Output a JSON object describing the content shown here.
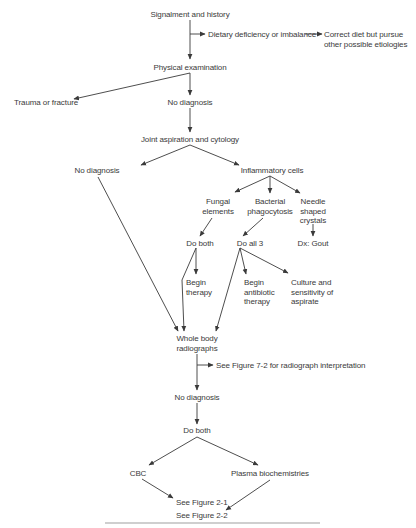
{
  "diagram": {
    "type": "flowchart",
    "nodes": {
      "signalment": "Signalment and history",
      "dietary": "Dietary deficiency or imbalance",
      "correct_diet_l1": "Correct diet but pursue",
      "correct_diet_l2": "other possible etiologies",
      "physical_exam": "Physical examination",
      "trauma": "Trauma or fracture",
      "no_dx_1": "No diagnosis",
      "joint_aspiration": "Joint aspiration and cytology",
      "no_dx_2": "No diagnosis",
      "inflammatory": "Inflammatory cells",
      "fungal_l1": "Fungal",
      "fungal_l2": "elements",
      "bacterial_l1": "Bacterial",
      "bacterial_l2": "phagocytosis",
      "needle_l1": "Needle",
      "needle_l2": "shaped",
      "needle_l3": "crystals",
      "do_both_1": "Do both",
      "do_all_3": "Do all 3",
      "gout": "Dx: Gout",
      "begin_therapy_l1": "Begin",
      "begin_therapy_l2": "therapy",
      "begin_abx_l1": "Begin",
      "begin_abx_l2": "antibiotic",
      "begin_abx_l3": "therapy",
      "culture_l1": "Culture and",
      "culture_l2": "sensitivity of",
      "culture_l3": "aspirate",
      "radiographs_l1": "Whole body",
      "radiographs_l2": "radiographs",
      "see_fig_7_2": "See Figure 7-2 for radiograph interpretation",
      "no_dx_3": "No diagnosis",
      "do_both_2": "Do both",
      "cbc": "CBC",
      "plasma": "Plasma biochemistries",
      "see_fig_2_1": "See Figure 2-1",
      "see_fig_2_2": "See Figure 2-2"
    },
    "edges": [
      [
        "Signalment and history",
        "Physical examination"
      ],
      [
        "Signalment and history",
        "Dietary deficiency or imbalance"
      ],
      [
        "Dietary deficiency or imbalance",
        "Correct diet but pursue other possible etiologies"
      ],
      [
        "Physical examination",
        "Trauma or fracture"
      ],
      [
        "Physical examination",
        "No diagnosis"
      ],
      [
        "No diagnosis",
        "Joint aspiration and cytology"
      ],
      [
        "Joint aspiration and cytology",
        "No diagnosis"
      ],
      [
        "Joint aspiration and cytology",
        "Inflammatory cells"
      ],
      [
        "Inflammatory cells",
        "Fungal elements"
      ],
      [
        "Inflammatory cells",
        "Bacterial phagocytosis"
      ],
      [
        "Inflammatory cells",
        "Needle shaped crystals"
      ],
      [
        "Fungal elements",
        "Do both"
      ],
      [
        "Bacterial phagocytosis",
        "Do all 3"
      ],
      [
        "Needle shaped crystals",
        "Dx: Gout"
      ],
      [
        "Do both",
        "Begin therapy"
      ],
      [
        "Do both",
        "Whole body radiographs"
      ],
      [
        "Do all 3",
        "Begin antibiotic therapy"
      ],
      [
        "Do all 3",
        "Culture and sensitivity of aspirate"
      ],
      [
        "Do all 3",
        "Whole body radiographs"
      ],
      [
        "No diagnosis (aspiration)",
        "Whole body radiographs"
      ],
      [
        "Whole body radiographs",
        "See Figure 7-2 for radiograph interpretation"
      ],
      [
        "Whole body radiographs",
        "No diagnosis"
      ],
      [
        "No diagnosis",
        "Do both"
      ],
      [
        "Do both",
        "CBC"
      ],
      [
        "Do both",
        "Plasma biochemistries"
      ],
      [
        "CBC",
        "See Figure 2-1"
      ],
      [
        "Plasma biochemistries",
        "See Figure 2-2"
      ]
    ]
  }
}
